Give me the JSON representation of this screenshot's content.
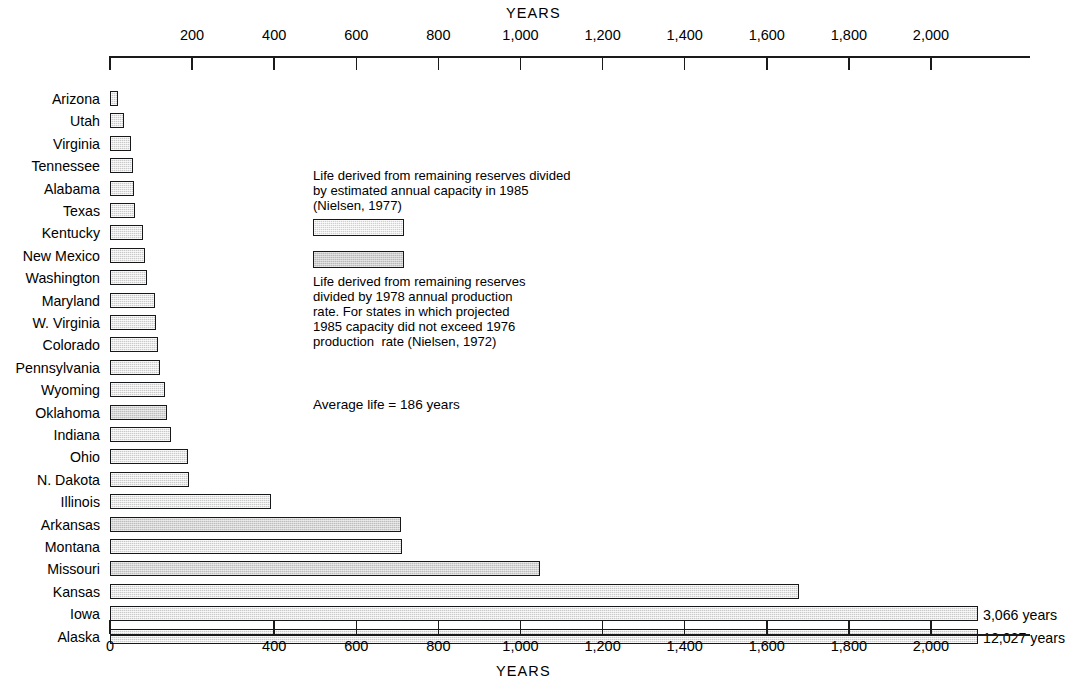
{
  "chart_data": {
    "type": "bar",
    "orientation": "horizontal",
    "title": "",
    "xlabel": "YEARS",
    "ylabel": "",
    "xlim": [
      0,
      2130
    ],
    "grid": false,
    "legend_position": "inside-center",
    "axis_top_label": "YEARS",
    "axis_bottom_label": "YEARS",
    "top_ticks": [
      "200",
      "400",
      "600",
      "800",
      "1,000",
      "1,200",
      "1,400",
      "1,600",
      "1,800",
      "2,000"
    ],
    "top_tick_values": [
      200,
      400,
      600,
      800,
      1000,
      1200,
      1400,
      1600,
      1800,
      2000
    ],
    "bottom_ticks": [
      "0",
      "400",
      "600",
      "800",
      "1,000",
      "1,200",
      "1,400",
      "1,600",
      "1,800",
      "2,000"
    ],
    "bottom_tick_values": [
      0,
      400,
      600,
      800,
      1000,
      1200,
      1400,
      1600,
      1800,
      2000
    ],
    "categories": [
      "Arizona",
      "Utah",
      "Virginia",
      "Tennessee",
      "Alabama",
      "Texas",
      "Kentucky",
      "New Mexico",
      "Washington",
      "Maryland",
      "W. Virginia",
      "Colorado",
      "Pennsylvania",
      "Wyoming",
      "Oklahoma",
      "Indiana",
      "Ohio",
      "N. Dakota",
      "Illinois",
      "Arkansas",
      "Montana",
      "Missouri",
      "Kansas",
      "Iowa",
      "Alaska"
    ],
    "values": [
      20,
      33,
      52,
      55,
      58,
      62,
      80,
      85,
      90,
      110,
      112,
      118,
      122,
      135,
      140,
      148,
      190,
      192,
      392,
      708,
      712,
      1048,
      1678,
      3066,
      12027
    ],
    "series_kind": [
      "capacity",
      "capacity",
      "capacity",
      "capacity",
      "capacity",
      "capacity",
      "capacity",
      "capacity",
      "capacity",
      "capacity",
      "capacity",
      "capacity",
      "capacity",
      "capacity",
      "production",
      "capacity",
      "capacity",
      "capacity",
      "capacity",
      "production",
      "capacity",
      "production",
      "capacity",
      "capacity",
      "capacity"
    ],
    "truncated": {
      "Iowa": true,
      "Alaska": true
    },
    "value_labels": [
      {
        "category": "Iowa",
        "text": "3,066 years"
      },
      {
        "category": "Alaska",
        "text": "12,027 years"
      }
    ],
    "annotations": [
      {
        "id": "legend-capacity",
        "text": "Life derived from remaining reserves divided\nby estimated annual capacity in 1985\n(Nielsen, 1977)"
      },
      {
        "id": "legend-production",
        "text": "Life derived from remaining reserves\ndivided by 1978 annual production\nrate. For states in which projected\n1985 capacity did not exceed 1976\nproduction  rate (Nielsen, 1972)"
      },
      {
        "id": "average-life",
        "text": "Average life = 186 years"
      }
    ],
    "average_life_years": 186,
    "colors": {
      "bar_fill": "#c9c9c9",
      "bar_fill_dense": "#bdbdbd",
      "bar_stroke": "#16181a",
      "axis": "#1a1a1a",
      "text": "#000000",
      "background": "#ffffff"
    }
  }
}
